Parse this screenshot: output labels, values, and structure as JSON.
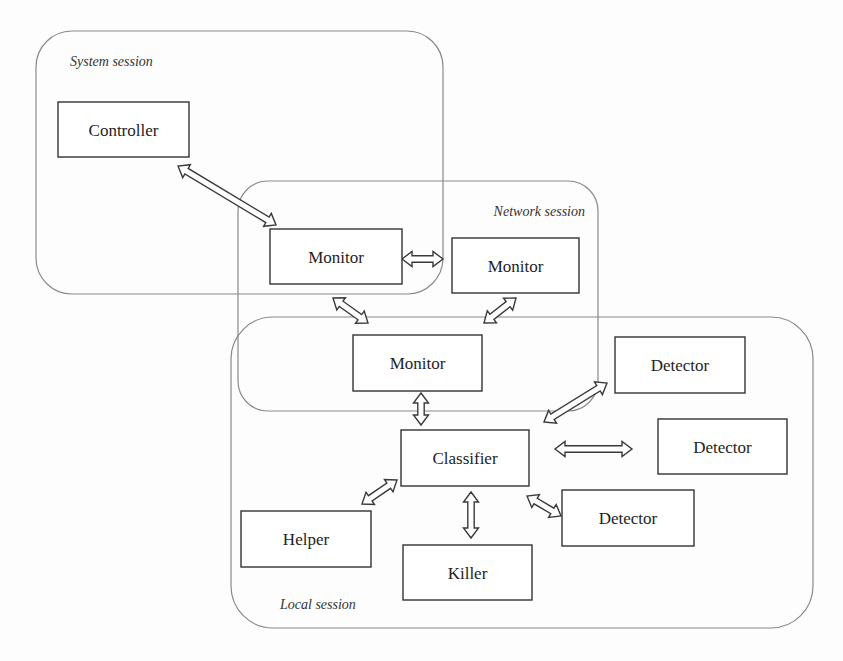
{
  "diagram": {
    "type": "architecture-block-diagram",
    "sessions": [
      {
        "id": "system",
        "label": "System session",
        "contains": [
          "controller",
          "monitor1"
        ]
      },
      {
        "id": "network",
        "label": "Network session",
        "contains": [
          "monitor1",
          "monitor2",
          "monitor3"
        ]
      },
      {
        "id": "local",
        "label": "Local session",
        "contains": [
          "monitor3",
          "classifier",
          "detector1",
          "detector2",
          "detector3",
          "helper",
          "killer"
        ]
      }
    ],
    "nodes": [
      {
        "id": "controller",
        "label": "Controller"
      },
      {
        "id": "monitor1",
        "label": "Monitor"
      },
      {
        "id": "monitor2",
        "label": "Monitor"
      },
      {
        "id": "monitor3",
        "label": "Monitor"
      },
      {
        "id": "classifier",
        "label": "Classifier"
      },
      {
        "id": "detector1",
        "label": "Detector"
      },
      {
        "id": "detector2",
        "label": "Detector"
      },
      {
        "id": "detector3",
        "label": "Detector"
      },
      {
        "id": "helper",
        "label": "Helper"
      },
      {
        "id": "killer",
        "label": "Killer"
      }
    ],
    "edges": [
      {
        "from": "controller",
        "to": "monitor1",
        "direction": "bidirectional"
      },
      {
        "from": "monitor1",
        "to": "monitor2",
        "direction": "bidirectional"
      },
      {
        "from": "monitor1",
        "to": "monitor3",
        "direction": "bidirectional"
      },
      {
        "from": "monitor2",
        "to": "monitor3",
        "direction": "bidirectional"
      },
      {
        "from": "monitor3",
        "to": "classifier",
        "direction": "bidirectional"
      },
      {
        "from": "classifier",
        "to": "detector1",
        "direction": "bidirectional"
      },
      {
        "from": "classifier",
        "to": "detector2",
        "direction": "bidirectional"
      },
      {
        "from": "classifier",
        "to": "detector3",
        "direction": "bidirectional"
      },
      {
        "from": "classifier",
        "to": "helper",
        "direction": "bidirectional"
      },
      {
        "from": "classifier",
        "to": "killer",
        "direction": "bidirectional"
      }
    ]
  }
}
